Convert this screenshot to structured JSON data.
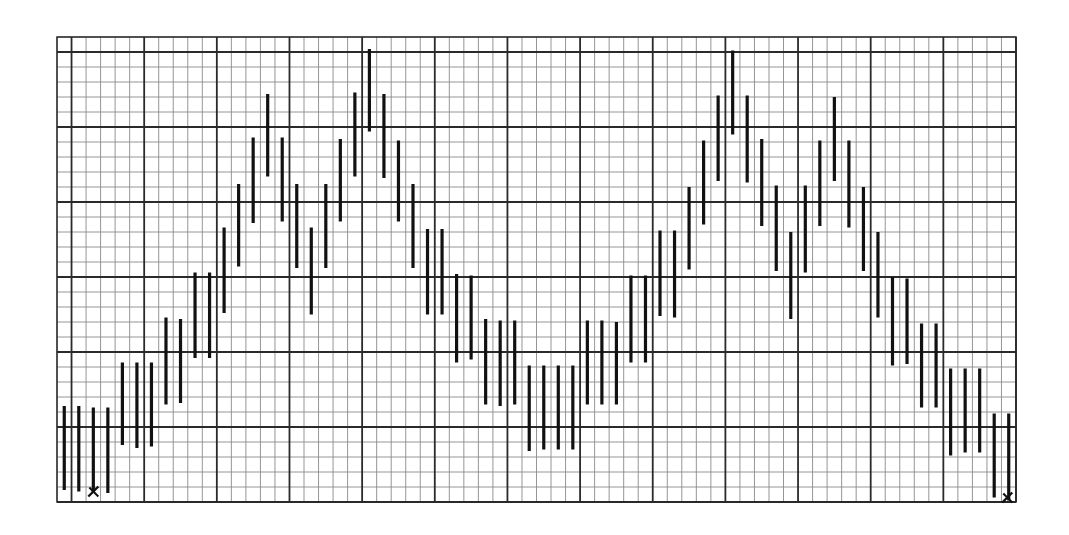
{
  "chart_data": {
    "type": "bar",
    "subtype": "high-low range bars on graph paper",
    "title": "",
    "xlabel": "",
    "ylabel": "",
    "grid": true,
    "legend": null,
    "grid_spec": {
      "columns": 66,
      "rows": 31,
      "major_every_cols": 5,
      "major_every_rows": 5,
      "major_col_offset": 1,
      "major_row_offset_from_top": 1
    },
    "xlim": [
      0,
      66
    ],
    "ylim": [
      0,
      31
    ],
    "x": [
      0,
      1,
      2,
      3,
      4,
      5,
      6,
      7,
      8,
      9,
      10,
      11,
      12,
      13,
      14,
      15,
      16,
      17,
      18,
      19,
      20,
      21,
      22,
      23,
      24,
      25,
      26,
      27,
      28,
      29,
      30,
      31,
      32,
      33,
      34,
      35,
      36,
      37,
      38,
      39,
      40,
      41,
      42,
      43,
      44,
      45,
      46,
      47,
      48,
      49,
      50,
      51,
      52,
      53,
      54,
      55,
      56,
      57,
      58,
      59,
      60,
      61,
      62,
      63,
      64,
      65
    ],
    "series": [
      {
        "name": "high",
        "values": [
          6.4,
          6.4,
          6.3,
          6.3,
          9.3,
          9.3,
          9.3,
          12.3,
          12.2,
          15.3,
          15.3,
          18.3,
          21.2,
          24.3,
          27.2,
          24.3,
          21.2,
          18.3,
          21.2,
          24.2,
          27.3,
          30.2,
          27.2,
          24.1,
          21.2,
          18.2,
          18.2,
          15.2,
          15.1,
          12.2,
          12.1,
          12.1,
          9.1,
          9.1,
          9.1,
          9.1,
          12.1,
          12.1,
          12.0,
          15.1,
          15.1,
          18.1,
          18.1,
          21.0,
          24.1,
          27.1,
          30.1,
          27.1,
          24.2,
          21.1,
          18.0,
          21.1,
          24.1,
          27.0,
          24.1,
          21.0,
          18.0,
          15.0,
          14.9,
          11.9,
          11.9,
          8.9,
          8.9,
          8.9,
          5.9,
          5.9
        ]
      },
      {
        "name": "low",
        "values": [
          0.8,
          0.7,
          0.6,
          0.6,
          3.8,
          3.6,
          3.7,
          6.5,
          6.6,
          9.6,
          9.6,
          12.6,
          15.7,
          18.6,
          21.7,
          18.7,
          15.6,
          12.5,
          15.6,
          18.7,
          21.7,
          24.7,
          21.6,
          18.7,
          15.6,
          12.5,
          12.5,
          9.3,
          9.5,
          6.5,
          6.4,
          6.5,
          3.4,
          3.5,
          3.5,
          3.5,
          6.5,
          6.5,
          6.5,
          9.3,
          9.3,
          12.4,
          12.3,
          15.5,
          18.5,
          21.4,
          24.5,
          21.3,
          18.4,
          15.4,
          12.2,
          15.3,
          18.4,
          21.4,
          18.3,
          15.4,
          12.3,
          9.1,
          9.2,
          6.3,
          6.3,
          3.1,
          3.3,
          3.3,
          0.3,
          0.1
        ]
      }
    ],
    "annotations": [
      {
        "type": "x-marker",
        "label": "✕",
        "x": 2.5,
        "y": 0.5
      },
      {
        "type": "x-marker",
        "label": "✕",
        "x": 65.4,
        "y": 0.1
      }
    ]
  },
  "style": {
    "background": "#ffffff",
    "grid_minor_color": "#8a8a8a",
    "grid_major_color": "#2a2a2a",
    "bar_color": "#111111",
    "marker_color": "#111111"
  },
  "layout": {
    "plot_left": 57,
    "plot_top": 37,
    "plot_right": 1016,
    "plot_bottom": 502
  }
}
